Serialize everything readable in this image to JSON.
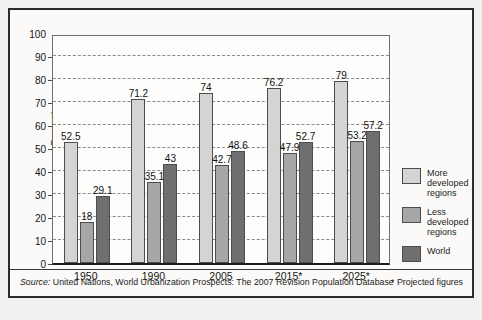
{
  "chart_data": {
    "type": "bar",
    "title": "",
    "subtitle": "",
    "xlabel": "",
    "ylabel": "Percent",
    "ylim": [
      0,
      100
    ],
    "ytick_step": 10,
    "yticks": [
      0,
      10,
      20,
      30,
      40,
      50,
      60,
      70,
      80,
      90,
      100
    ],
    "grid": true,
    "grid_style": "dashed-horizontal",
    "legend_position": "right",
    "categories": [
      "1950",
      "1990",
      "2005",
      "2015*",
      "2025*"
    ],
    "series": [
      {
        "name": "More developed regions",
        "color": "#d4d4d4",
        "values": [
          52.5,
          71.2,
          74,
          76.2,
          79
        ],
        "labels": [
          "52.5",
          "71.2",
          "74",
          "76.2",
          "79"
        ]
      },
      {
        "name": "Less developed regions",
        "color": "#a6a6a6",
        "values": [
          18,
          35.1,
          42.7,
          47.9,
          53.2
        ],
        "labels": [
          "18",
          "35.1",
          "42.7",
          "47.9",
          "53.2"
        ]
      },
      {
        "name": "World",
        "color": "#6f6f6f",
        "values": [
          29.1,
          43,
          48.6,
          52.7,
          57.2
        ],
        "labels": [
          "29.1",
          "43",
          "48.6",
          "52.7",
          "57.2"
        ]
      }
    ],
    "annotations": [
      "Source: United Nations, World Urbanization Prospects: The 2007 Revision Population Database",
      "* Projected figures"
    ]
  },
  "axis": {
    "y_title": "Percent",
    "y_tick_labels": [
      "100",
      "90",
      "80",
      "70",
      "60",
      "50",
      "40",
      "30",
      "20",
      "10",
      "0"
    ],
    "x_tick_labels": [
      "1950",
      "1990",
      "2005",
      "2015*",
      "2025*"
    ]
  },
  "legend": {
    "items": [
      {
        "label": "More developed regions",
        "swatch": "more",
        "color": "#d4d4d4"
      },
      {
        "label": "Less developed regions",
        "swatch": "less",
        "color": "#a6a6a6"
      },
      {
        "label": "World",
        "swatch": "world",
        "color": "#6f6f6f"
      }
    ]
  },
  "footer": {
    "source_prefix": "Source:",
    "source_text": " United Nations, World Urbanization Prospects: The 2007 Revision Population Database",
    "projected_note": "* Projected figures"
  },
  "colors": {
    "more_developed": "#d4d4d4",
    "less_developed": "#a6a6a6",
    "world": "#6f6f6f",
    "frame": "#2b2b2b",
    "background": "#fbfaf8",
    "gridline": "#8a8a8a"
  }
}
